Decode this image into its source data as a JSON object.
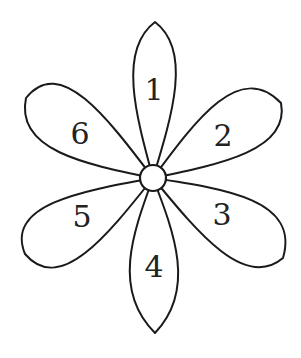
{
  "diagram": {
    "type": "flower",
    "petals": [
      {
        "label": "1",
        "direction": "up"
      },
      {
        "label": "2",
        "direction": "upper-right"
      },
      {
        "label": "3",
        "direction": "lower-right"
      },
      {
        "label": "4",
        "direction": "down"
      },
      {
        "label": "5",
        "direction": "lower-left"
      },
      {
        "label": "6",
        "direction": "upper-left"
      }
    ],
    "colors": {
      "stroke": "#1a1a1a",
      "fill": "#ffffff",
      "background": "#ffffff"
    }
  }
}
